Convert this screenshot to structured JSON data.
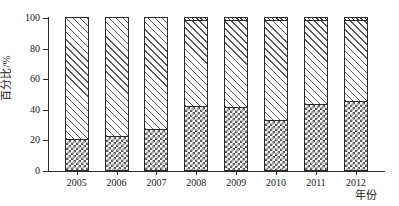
{
  "chart_data": {
    "type": "bar",
    "stacked": true,
    "title": "",
    "subtitle": "",
    "xlabel": "年份",
    "ylabel": "百分比/%",
    "categories": [
      "2005",
      "2006",
      "2007",
      "2008",
      "2009",
      "2010",
      "2011",
      "2012"
    ],
    "ylim": [
      0,
      100
    ],
    "yticks": [
      0,
      20,
      40,
      60,
      80,
      100
    ],
    "ytick_labels": [
      "0",
      "20",
      "40",
      "60",
      "80",
      "100"
    ],
    "grid": false,
    "legend": "none",
    "series": [
      {
        "name": "series-1-crosshatch",
        "pattern": "checkerboard",
        "values": [
          20,
          22,
          27,
          42,
          41,
          33,
          43,
          45
        ]
      },
      {
        "name": "series-2-diagonal-hatch",
        "pattern": "diagonal-hatch",
        "values": [
          80,
          78,
          73,
          56,
          57,
          65,
          55,
          53
        ]
      },
      {
        "name": "series-3-top-cap",
        "pattern": "fine-hatch",
        "values": [
          0,
          0,
          0,
          2,
          2,
          2,
          2,
          2
        ]
      }
    ]
  },
  "axes": {
    "y_title": "百分比/%",
    "x_title": "年份",
    "y_tick_labels": [
      "0",
      "20",
      "40",
      "60",
      "80",
      "100"
    ],
    "x_tick_labels": [
      "2005",
      "2006",
      "2007",
      "2008",
      "2009",
      "2010",
      "2011",
      "2012"
    ]
  },
  "colors": {
    "ink": "#2b2b2b",
    "hatch": "#585858",
    "background": "#ffffff"
  }
}
